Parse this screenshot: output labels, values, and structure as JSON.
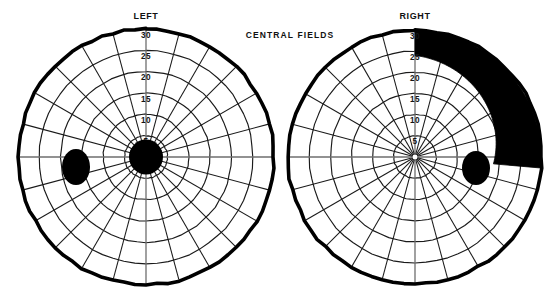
{
  "page": {
    "background": "#ffffff",
    "width": 554,
    "height": 300,
    "ink_color": "#000000"
  },
  "header": {
    "center_title": "CENTRAL  FIELDS"
  },
  "charts": [
    {
      "id": "left-eye",
      "title": "LEFT",
      "center": {
        "x": 146,
        "y": 157
      },
      "outer_radius": 128,
      "ring_labels": [
        "30",
        "25",
        "20",
        "15",
        "10",
        "5"
      ],
      "ring_values": [
        30,
        25,
        20,
        15,
        10,
        5
      ],
      "spokes": 24,
      "spoke_step_degrees": 15,
      "fixation_blob": {
        "name": "central-scotoma",
        "cx": 146,
        "cy": 157,
        "rx": 17,
        "ry": 17.5,
        "color": "#000000"
      },
      "blind_spot": {
        "name": "blind-spot",
        "cx": 76,
        "cy": 167,
        "rx": 14,
        "ry": 18,
        "color": "#000000"
      },
      "defect_wedge": null
    },
    {
      "id": "right-eye",
      "title": "RIGHT",
      "center": {
        "x": 415,
        "y": 157
      },
      "outer_radius": 127,
      "ring_labels": [
        "30",
        "25",
        "20",
        "15",
        "10",
        "5"
      ],
      "ring_values": [
        30,
        25,
        20,
        15,
        10,
        5
      ],
      "spokes": 24,
      "spoke_step_degrees": 15,
      "fixation_blob": null,
      "blind_spot": {
        "name": "blind-spot",
        "cx": 476,
        "cy": 168,
        "rx": 14,
        "ry": 17,
        "color": "#000000"
      },
      "defect_wedge": {
        "name": "superior-temporal-defect",
        "start_angle_degrees": 0,
        "end_angle_degrees": 95,
        "inner_radius_at_start": 0.8,
        "inner_radius_at_end": 0.62,
        "color": "#000000",
        "description": "filled black crescent from vertical meridian clockwise into temporal field"
      }
    }
  ],
  "chart_data": {
    "type": "scatter",
    "title": "CENTRAL  FIELDS",
    "plots": [
      {
        "name": "LEFT",
        "coordinate_system": "polar-visual-field",
        "radial_axis_label": "degrees of eccentricity",
        "radial_ticks": [
          5,
          10,
          15,
          20,
          25,
          30
        ],
        "rlim": [
          0,
          30
        ],
        "angular_ticks_degrees": [
          0,
          15,
          30,
          45,
          60,
          75,
          90,
          105,
          120,
          135,
          150,
          165,
          180,
          195,
          210,
          225,
          240,
          255,
          270,
          285,
          300,
          315,
          330,
          345
        ],
        "grid": true,
        "markers": [
          {
            "label": "central scotoma",
            "r": 0,
            "theta": 0,
            "radius_deg": 4.0,
            "fill": "#000000"
          },
          {
            "label": "blind spot",
            "r": 16.5,
            "theta": 188,
            "radius_deg": 3.8,
            "fill": "#000000"
          }
        ],
        "regions": []
      },
      {
        "name": "RIGHT",
        "coordinate_system": "polar-visual-field",
        "radial_axis_label": "degrees of eccentricity",
        "radial_ticks": [
          5,
          10,
          15,
          20,
          25,
          30
        ],
        "rlim": [
          0,
          30
        ],
        "angular_ticks_degrees": [
          0,
          15,
          30,
          45,
          60,
          75,
          90,
          105,
          120,
          135,
          150,
          165,
          180,
          195,
          210,
          225,
          240,
          255,
          270,
          285,
          300,
          315,
          330,
          345
        ],
        "grid": true,
        "markers": [
          {
            "label": "blind spot",
            "r": 14.5,
            "theta": 350,
            "radius_deg": 3.8,
            "fill": "#000000"
          }
        ],
        "regions": [
          {
            "label": "superior temporal field defect",
            "theta_start_deg": 0,
            "theta_end_deg": 95,
            "r_inner_deg_at_start": 24,
            "r_inner_deg_at_end": 18.5,
            "r_outer_deg": 30,
            "fill": "#000000"
          }
        ]
      }
    ]
  }
}
